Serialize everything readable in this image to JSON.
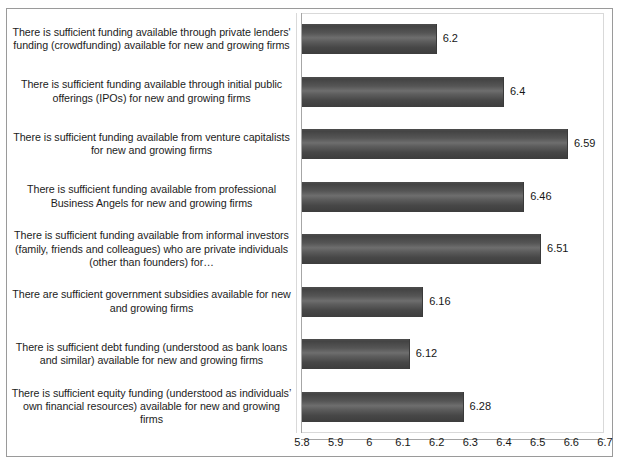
{
  "chart_data": {
    "type": "bar",
    "orientation": "horizontal",
    "title": "",
    "subtitle": "",
    "xlabel": "",
    "ylabel": "",
    "grid": false,
    "legend": false,
    "legend_position": "none",
    "xlim": [
      5.8,
      6.7
    ],
    "xtick_step": 0.1,
    "tick_labels": [
      "5.8",
      "5.9",
      "6",
      "6.1",
      "6.2",
      "6.3",
      "6.4",
      "6.5",
      "6.6",
      "6.7"
    ],
    "tick_values": [
      5.8,
      5.9,
      6.0,
      6.1,
      6.2,
      6.3,
      6.4,
      6.5,
      6.6,
      6.7
    ],
    "bar_color": "#555555",
    "categories": [
      "There is sufficient funding available through private lenders' funding (crowdfunding) available for new and growing firms",
      "There is sufficient funding available through initial public offerings (IPOs) for new and growing firms",
      "There is sufficient funding available from venture capitalists for new and growing firms",
      "There is sufficient funding available from professional Business Angels for new and growing firms",
      "There is sufficient funding available from informal investors (family, friends and colleagues) who are private individuals (other than founders) for…",
      "There are sufficient government subsidies available for new and growing firms",
      "There is sufficient debt funding (understood as bank loans and similar) available for new and growing firms",
      "There is sufficient equity funding (understood as individuals’ own financial resources) available for new and growing firms"
    ],
    "values": [
      6.2,
      6.4,
      6.59,
      6.46,
      6.51,
      6.16,
      6.12,
      6.28
    ],
    "value_labels": [
      "6.2",
      "6.4",
      "6.59",
      "6.46",
      "6.51",
      "6.16",
      "6.12",
      "6.28"
    ]
  }
}
